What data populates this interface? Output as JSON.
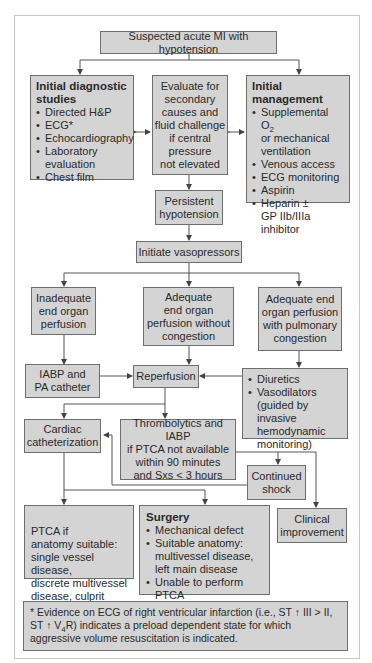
{
  "colors": {
    "box_fill": "#d4d4d4",
    "box_border": "#6e6e6e",
    "line": "#555555"
  },
  "nodes": {
    "start": "Suspected acute MI with hypotension",
    "diagnostic": {
      "title": "Initial diagnostic\nstudies",
      "items": [
        "Directed H&P",
        "ECG*",
        "Echocardiography",
        "Laboratory\nevaluation",
        "Chest film"
      ]
    },
    "evaluate": "Evaluate for\nsecondary\ncauses and\nfluid challenge\nif central\npressure\nnot elevated",
    "management": {
      "title": "Initial\nmanagement",
      "item0_prefix": "Supplemental O",
      "item0_sub": "2",
      "item0_suffix": "\nor mechanical\nventilation",
      "items": [
        "Venous access",
        "ECG monitoring",
        "Aspirin",
        "Heparin ±\nGP IIb/IIIa\ninhibitor"
      ]
    },
    "persistent": "Persistent\nhypotension",
    "vasopressors": "Initiate vasopressors",
    "inadequate": "Inadequate\nend organ\nperfusion",
    "adequate_no_congestion": "Adequate\nend organ\nperfusion without\ncongestion",
    "adequate_congestion": "Adequate end\norgan perfusion\nwith pulmonary\ncongestion",
    "iabp": "IABP and\nPA catheter",
    "reperfusion": "Reperfusion",
    "diuretics": {
      "items": [
        "Diuretics",
        "Vasodilators\n(guided by invasive\nhemodynamic\nmonitoring)"
      ]
    },
    "cardiac_cath": "Cardiac\ncatheterization",
    "thrombolytics": "Thrombolytics and IABP\nif PTCA not available\nwithin 90 minutes\nand Sxs < 3 hours",
    "continued_shock": "Continued\nshock",
    "ptca": "PTCA if\nanatomy suitable:\nsingle vessel disease,\ndiscrete multivessel\ndisease, culprit lesion",
    "surgery": {
      "title": "Surgery",
      "items": [
        "Mechanical defect",
        "Suitable anatomy:\nmultivessel disease,\nleft main disease",
        "Unable to perform PTCA"
      ]
    },
    "clinical": "Clinical\nimprovement"
  },
  "footnote": {
    "line1_a": "* Evidence on ECG of right ventricular infarction (i.e., ST ",
    "arrow": "↑",
    "line1_b": " III > II,",
    "line2_a": "ST ",
    "line2_b": " V",
    "line2_sub": "4",
    "line2_c": "R) indicates a preload dependent state for which aggressive volume resuscitation is indicated."
  }
}
